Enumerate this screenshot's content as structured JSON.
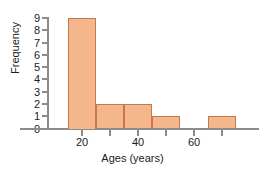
{
  "chart_data": {
    "type": "bar",
    "title": "",
    "subtitle": "",
    "xlabel": "Ages (years)",
    "ylabel": "Frequency",
    "xlim": [
      10,
      78
    ],
    "ylim": [
      0,
      9
    ],
    "grid": false,
    "legend": false,
    "bin_width": 10,
    "bin_edges": [
      15,
      25,
      35,
      45,
      55,
      65,
      75
    ],
    "categories": [
      "15-25",
      "25-35",
      "35-45",
      "45-55",
      "55-65",
      "65-75"
    ],
    "values": [
      9,
      2,
      2,
      1,
      0,
      1
    ],
    "xticks": [
      20,
      40,
      60
    ],
    "xticklabels": [
      "20",
      "40",
      "60"
    ],
    "xminorticks": [
      30,
      50,
      70
    ],
    "yticks": [
      0,
      1,
      2,
      3,
      4,
      5,
      6,
      7,
      8,
      9
    ],
    "yticklabels": [
      "0",
      "1",
      "2",
      "3",
      "4",
      "5",
      "6",
      "7",
      "8",
      "9"
    ],
    "bar_fill_color": "#F4B68C",
    "bar_edge_color": "#C8764A",
    "axis_color": "#8C8C8C",
    "text_color": "#1C1C1C",
    "background_color": "#FFFFFF"
  }
}
